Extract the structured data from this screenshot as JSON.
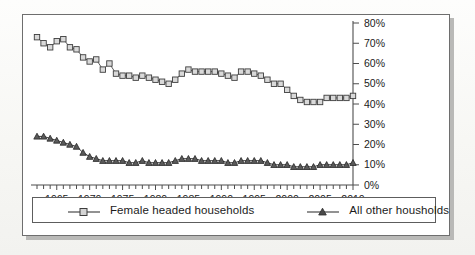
{
  "chart_data": {
    "type": "line",
    "title": "",
    "subtitle": "",
    "xlabel": "",
    "ylabel": "",
    "xlim": [
      1962,
      2010
    ],
    "ylim": [
      0,
      80
    ],
    "ytick_labels": [
      "0%",
      "10%",
      "20%",
      "30%",
      "40%",
      "50%",
      "60%",
      "70%",
      "80%"
    ],
    "ytick_values": [
      0,
      10,
      20,
      30,
      40,
      50,
      60,
      70,
      80
    ],
    "xtick_labels": [
      "1965",
      "1970",
      "1975",
      "1980",
      "1985",
      "1990",
      "1995",
      "2000",
      "2005",
      "2010"
    ],
    "xtick_values": [
      1965,
      1970,
      1975,
      1980,
      1985,
      1990,
      1995,
      2000,
      2005,
      2010
    ],
    "x_minor_tick_interval": 1,
    "y_axis_position": "right",
    "grid": false,
    "legend_position": "bottom",
    "x": [
      1962,
      1963,
      1964,
      1965,
      1966,
      1967,
      1968,
      1969,
      1970,
      1971,
      1972,
      1973,
      1974,
      1975,
      1976,
      1977,
      1978,
      1979,
      1980,
      1981,
      1982,
      1983,
      1984,
      1985,
      1986,
      1987,
      1988,
      1989,
      1990,
      1991,
      1992,
      1993,
      1994,
      1995,
      1996,
      1997,
      1998,
      1999,
      2000,
      2001,
      2002,
      2003,
      2004,
      2005,
      2006,
      2007,
      2008,
      2009,
      2010
    ],
    "series": [
      {
        "name": "Female headed households",
        "marker": "square",
        "color": "#5a5a5a",
        "values": [
          73,
          70,
          68,
          71,
          72,
          68,
          67,
          63,
          61,
          62,
          57,
          60,
          55,
          54,
          54,
          53,
          54,
          53,
          52,
          51,
          50,
          52,
          55,
          57,
          56,
          56,
          56,
          56,
          55,
          54,
          53,
          56,
          56,
          55,
          54,
          52,
          50,
          50,
          47,
          44,
          42,
          41,
          41,
          41,
          43,
          43,
          43,
          43,
          44
        ]
      },
      {
        "name": "All other housholds",
        "marker": "triangle",
        "color": "#3a3a3a",
        "values": [
          24,
          24,
          23,
          22,
          21,
          20,
          19,
          16,
          14,
          13,
          12,
          12,
          12,
          12,
          11,
          11,
          12,
          11,
          11,
          11,
          11,
          12,
          13,
          13,
          13,
          12,
          12,
          12,
          12,
          11,
          11,
          12,
          12,
          12,
          12,
          11,
          10,
          10,
          10,
          9,
          9,
          9,
          9,
          10,
          10,
          10,
          10,
          10,
          11
        ]
      }
    ]
  },
  "legend": {
    "entries": [
      {
        "label": "Female headed households",
        "marker": "square-marker-icon"
      },
      {
        "label": "All other housholds",
        "marker": "triangle-marker-icon"
      }
    ]
  }
}
